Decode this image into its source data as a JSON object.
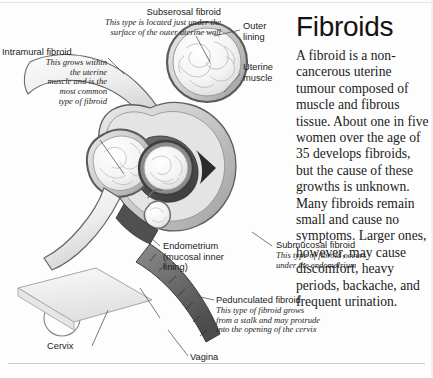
{
  "article": {
    "title": "Fibroids",
    "body": "A fibroid is a non-cancerous uterine tumour composed of muscle and fibrous tissue. About one in five women over the age of 35 develops fibroids, but the cause of these growths is unknown. Many fibroids remain small and cause no symptoms. Larger ones, however, may cause discomfort, heavy periods, backache, and frequent urination."
  },
  "labels": {
    "subserosal": {
      "title": "Subserosal fibroid",
      "description": "This type is located just under the\nsurface of the outer uterine wall"
    },
    "intramural": {
      "title": "Intramural fibroid",
      "description": "This grows within\nthe uterine\nmuscle and is the\nmost common\ntype of fibroid"
    },
    "outer_lining": {
      "title": "Outer\nlining"
    },
    "uterine_muscle": {
      "title": "Uterine\nmuscle"
    },
    "endometrium": {
      "title": "Endometrium\n(mucosal inner\nlining)"
    },
    "submucosal": {
      "title": "Submucosal fibroid",
      "description": "This type of fibroid occurs\nunder the endometrium"
    },
    "pedunculated": {
      "title": "Pedunculated fibroid",
      "description": "This type of fibroid grows\nfrom a stalk and may protrude\ninto the opening of the cervix"
    },
    "cervix": {
      "title": "Cervix"
    },
    "vagina": {
      "title": "Vagina"
    }
  },
  "colors": {
    "page_background": "#fdfdfd",
    "text": "#1a1a1a",
    "ink_outline": "#4a4a4a",
    "tissue_light": "#f2f2f2",
    "tissue_mid": "#c9c9c9",
    "cavity_dark": "#5c5c5c",
    "rule": "#c9c9c9"
  }
}
